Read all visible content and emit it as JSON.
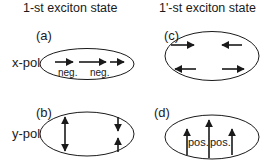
{
  "columns": [
    {
      "title": "1-st exciton state"
    },
    {
      "title": "1'-st exciton state"
    }
  ],
  "rows": [
    {
      "label": "x-pol"
    },
    {
      "label": "y-pol"
    }
  ],
  "panels": {
    "a": {
      "label": "(a)",
      "annotations": [
        "neg.",
        "neg."
      ],
      "arrows": [
        "right",
        "right",
        "right"
      ]
    },
    "b": {
      "label": "(b)",
      "arrows": [
        "left: up+down double arrow",
        "right-top: down",
        "right-bottom: up"
      ]
    },
    "c": {
      "label": "(c)",
      "arrows": [
        "top-left: right",
        "top-right: left",
        "bottom-left: left",
        "bottom-right: right"
      ]
    },
    "d": {
      "label": "(d)",
      "annotations": [
        "pos.",
        "pos."
      ],
      "arrows": [
        "up",
        "up",
        "up"
      ]
    }
  },
  "colors": {
    "stroke": "#1a1a1a",
    "background": "#ffffff"
  }
}
